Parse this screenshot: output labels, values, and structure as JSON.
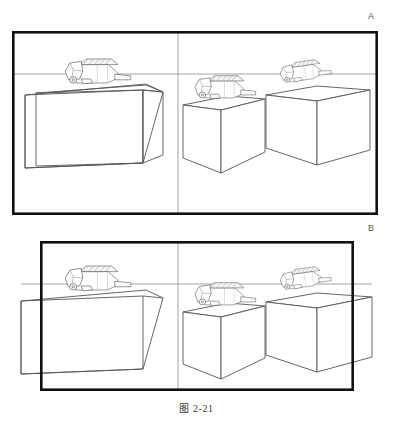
{
  "figure": {
    "caption": "图 2-21",
    "background_color": "#ffffff",
    "ink_color": "#1a1a1a",
    "line_color": "#555555",
    "frame_color": "#111111"
  },
  "panels": [
    {
      "id": "A",
      "label": "A",
      "label_position": {
        "x": 372,
        "y": 16
      },
      "frame": {
        "x": 12,
        "y": 31,
        "width": 366,
        "height": 184,
        "stroke_width": 2.6
      },
      "horizon_y": 74,
      "divider_x": 178,
      "description": "three rectangular boxes in perspective, each with a small machine on top, enclosed by a wide black frame",
      "objects": [
        {
          "name": "left-box",
          "machine": "vehicle-on-left-box"
        },
        {
          "name": "middle-box",
          "machine": "vehicle-on-middle-box"
        },
        {
          "name": "right-box",
          "machine": "vehicle-on-right-box"
        }
      ]
    },
    {
      "id": "B",
      "label": "B",
      "label_position": {
        "x": 372,
        "y": 228
      },
      "frame": {
        "x": 40,
        "y": 241,
        "width": 313,
        "height": 149,
        "stroke_width": 2.6
      },
      "horizon_y": 284,
      "divider_x": 178,
      "description": "same three boxes and machines, but the black frame is narrower so the scene overflows past the left and right frame edges",
      "objects": [
        {
          "name": "left-box",
          "machine": "vehicle-on-left-box"
        },
        {
          "name": "middle-box",
          "machine": "vehicle-on-middle-box"
        },
        {
          "name": "right-box",
          "machine": "vehicle-on-right-box"
        }
      ]
    }
  ]
}
